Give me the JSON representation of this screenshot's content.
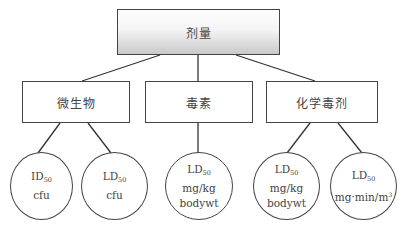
{
  "root": {
    "label": "剂量"
  },
  "categories": [
    {
      "label": "微生物"
    },
    {
      "label": "毒素"
    },
    {
      "label": "化学毒剂"
    }
  ],
  "leaves": [
    {
      "metric": "ID",
      "metric_sub": "50",
      "line2": "cfu",
      "line3": ""
    },
    {
      "metric": "LD",
      "metric_sub": "50",
      "line2": "cfu",
      "line3": ""
    },
    {
      "metric": "LD",
      "metric_sub": "50",
      "line2": "mg/kg",
      "line3": "bodywt"
    },
    {
      "metric": "LD",
      "metric_sub": "50",
      "line2": "mg/kg",
      "line3": "bodywt"
    },
    {
      "metric": "LD",
      "metric_sub": "50",
      "line2": "mg·min/m",
      "line2_sup": "3",
      "line3": ""
    }
  ],
  "colors": {
    "stroke": "#333333",
    "root_gradient_bottom": "#c9c9c9"
  }
}
